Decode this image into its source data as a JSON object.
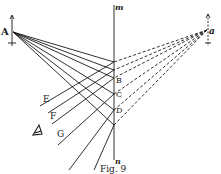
{
  "figure": {
    "caption": "Fig. 9",
    "mirror": {
      "top_label": "m",
      "bottom_label": "n",
      "x": 114,
      "y1": 5,
      "y2": 160
    },
    "object": {
      "label": "A",
      "x": 13,
      "y": 32
    },
    "image": {
      "label": "a",
      "x": 207,
      "y": 30
    },
    "reflection_points": [
      {
        "label": "",
        "y": 62
      },
      {
        "label": "",
        "y": 70
      },
      {
        "label": "B",
        "y": 78
      },
      {
        "label": "C",
        "y": 94
      },
      {
        "label": "D",
        "y": 110
      },
      {
        "label": "",
        "y": 125
      }
    ],
    "reflected_ray_labels": [
      "E",
      "F",
      "G"
    ],
    "eye_icon": "eye-icon",
    "colors": {
      "ink": "#1a1a1a",
      "paper": "#ffffff"
    }
  }
}
